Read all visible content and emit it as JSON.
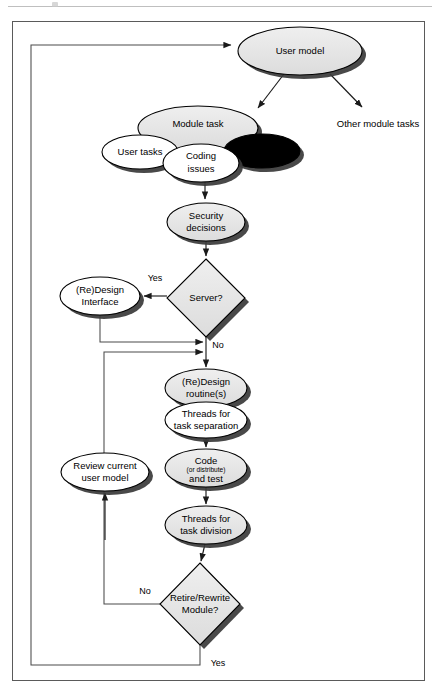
{
  "page": {
    "header_rule": true,
    "frame": {
      "x": 12,
      "y": 21,
      "w": 413,
      "h": 660
    }
  },
  "colors": {
    "node_fill": "#e6e6e6",
    "node_fill_alt": "#ffffff",
    "stroke": "#000000",
    "shadow": "#3a3a3a",
    "connector": "#4a4a4a",
    "background": "#ffffff",
    "header_rule": "#bfbfbf"
  },
  "diagram": {
    "type": "flowchart",
    "nodes": [
      {
        "id": "user_model",
        "shape": "ellipse",
        "label": "User model",
        "cx": 300,
        "cy": 51,
        "rx": 62,
        "ry": 24,
        "fill": "gray"
      },
      {
        "id": "module_task",
        "shape": "ellipse",
        "label": "Module task",
        "cx": 198,
        "cy": 128,
        "rx": 60,
        "ry": 22,
        "fill": "gray"
      },
      {
        "id": "user_tasks",
        "shape": "ellipse",
        "label": "User tasks",
        "cx": 140,
        "cy": 152,
        "rx": 38,
        "ry": 17,
        "fill": "white"
      },
      {
        "id": "resources",
        "shape": "ellipse",
        "label": "Resources",
        "cx": 262,
        "cy": 151,
        "rx": 38,
        "ry": 17,
        "fill": "white"
      },
      {
        "id": "coding_issues",
        "shape": "ellipse",
        "label": "Coding\nissues",
        "cx": 201,
        "cy": 163,
        "rx": 38,
        "ry": 19,
        "fill": "white"
      },
      {
        "id": "security",
        "shape": "ellipse",
        "label": "Security\ndecisions",
        "cx": 206,
        "cy": 222,
        "rx": 39,
        "ry": 19,
        "fill": "gray"
      },
      {
        "id": "server_q",
        "shape": "diamond",
        "label": "Server?",
        "cx": 206,
        "cy": 298,
        "rx": 39,
        "ry": 39,
        "fill": "gray"
      },
      {
        "id": "redesign_iface",
        "shape": "ellipse",
        "label": "(Re)Design\nInterface",
        "cx": 100,
        "cy": 296,
        "rx": 40,
        "ry": 19,
        "fill": "white"
      },
      {
        "id": "redesign_rt",
        "shape": "ellipse",
        "label": "(Re)Design\nroutine(s)",
        "cx": 206,
        "cy": 388,
        "rx": 41,
        "ry": 19,
        "fill": "gray"
      },
      {
        "id": "threads_sep",
        "shape": "ellipse",
        "label": "Threads for\ntask separation",
        "cx": 206,
        "cy": 420,
        "rx": 41,
        "ry": 18,
        "fill": "white"
      },
      {
        "id": "review_model",
        "shape": "ellipse",
        "label": "Review current\nuser model",
        "cx": 105,
        "cy": 472,
        "rx": 44,
        "ry": 19,
        "fill": "white"
      },
      {
        "id": "code_test",
        "shape": "ellipse",
        "label": "Code",
        "label2": "(or distribute)",
        "label3": "and test",
        "cx": 206,
        "cy": 468,
        "rx": 41,
        "ry": 19,
        "fill": "gray"
      },
      {
        "id": "threads_div",
        "shape": "ellipse",
        "label": "Threads for\ntask division",
        "cx": 206,
        "cy": 525,
        "rx": 41,
        "ry": 19,
        "fill": "gray"
      },
      {
        "id": "retire_q",
        "shape": "diamond",
        "label": "Retire/Rewrite\nModule?",
        "cx": 200,
        "cy": 604,
        "rx": 40,
        "ry": 41,
        "fill": "gray"
      },
      {
        "id": "other_tasks",
        "shape": "text",
        "label": "Other module tasks",
        "cx": 378,
        "cy": 124
      }
    ],
    "edge_labels": [
      {
        "id": "server_yes",
        "text": "Yes",
        "x": 155,
        "y": 279
      },
      {
        "id": "server_no",
        "text": "No",
        "x": 216,
        "y": 345
      },
      {
        "id": "retire_no",
        "text": "No",
        "x": 145,
        "y": 592
      },
      {
        "id": "retire_yes",
        "text": "Yes",
        "x": 216,
        "y": 663
      }
    ],
    "edges": [
      {
        "from": "user_model",
        "to": "module_task",
        "label": ""
      },
      {
        "from": "user_model",
        "to": "other_tasks",
        "label": ""
      },
      {
        "from": "coding_issues",
        "to": "security",
        "label": ""
      },
      {
        "from": "security",
        "to": "server_q",
        "label": ""
      },
      {
        "from": "server_q",
        "to": "redesign_iface",
        "label": "Yes"
      },
      {
        "from": "server_q",
        "to": "redesign_rt",
        "label": "No"
      },
      {
        "from": "redesign_iface",
        "to": "redesign_rt",
        "label": ""
      },
      {
        "from": "redesign_rt",
        "to": "threads_sep",
        "label": ""
      },
      {
        "from": "threads_sep",
        "to": "code_test",
        "label": ""
      },
      {
        "from": "code_test",
        "to": "threads_div",
        "label": ""
      },
      {
        "from": "threads_div",
        "to": "retire_q",
        "label": ""
      },
      {
        "from": "retire_q",
        "to": "review_model",
        "label": "No"
      },
      {
        "from": "retire_q",
        "to": "user_model",
        "label": "Yes"
      }
    ]
  }
}
